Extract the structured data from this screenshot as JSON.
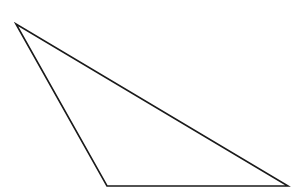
{
  "diagram": {
    "type": "triangle",
    "shape": "obtuse-scalene-triangle",
    "stroke_color": "#1a1a1a",
    "fill_color": "none",
    "background": "#ffffff",
    "vertices": [
      {
        "name": "top-left",
        "x": 16,
        "y": 24
      },
      {
        "name": "bottom-left",
        "x": 107,
        "y": 186
      },
      {
        "name": "bottom-right",
        "x": 288,
        "y": 186
      }
    ]
  }
}
